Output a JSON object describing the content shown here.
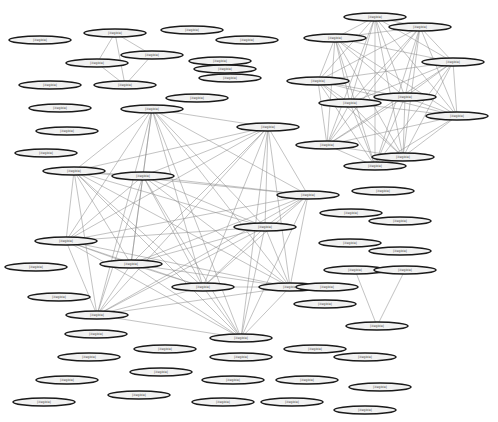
{
  "diagram": {
    "type": "network-graph",
    "node_shape": "ellipse",
    "label_note": "node labels are too small to read at this resolution; format resembles '#### ___ sample_########'",
    "colors": {
      "background": "#ffffff",
      "edge": "#8a8a8a",
      "node_fill": "#f2f2f2",
      "node_stroke": "#1a1a1a"
    },
    "nodes": [
      {
        "id": "n1",
        "x": 40,
        "y": 40,
        "w": 62,
        "label": "[illegible]"
      },
      {
        "id": "n2",
        "x": 115,
        "y": 33,
        "w": 62,
        "label": "[illegible]"
      },
      {
        "id": "n3",
        "x": 152,
        "y": 55,
        "w": 62,
        "label": "[illegible]"
      },
      {
        "id": "n4",
        "x": 97,
        "y": 63,
        "w": 62,
        "label": "[illegible]"
      },
      {
        "id": "n5",
        "x": 50,
        "y": 85,
        "w": 62,
        "label": "[illegible]"
      },
      {
        "id": "n6",
        "x": 125,
        "y": 85,
        "w": 62,
        "label": "[illegible]"
      },
      {
        "id": "n7",
        "x": 192,
        "y": 30,
        "w": 62,
        "label": "[illegible]"
      },
      {
        "id": "n8",
        "x": 247,
        "y": 40,
        "w": 62,
        "label": "[illegible]"
      },
      {
        "id": "n9",
        "x": 220,
        "y": 61,
        "w": 62,
        "label": "[illegible]"
      },
      {
        "id": "n10",
        "x": 225,
        "y": 69,
        "w": 62,
        "label": "[illegible]"
      },
      {
        "id": "n11",
        "x": 230,
        "y": 78,
        "w": 62,
        "label": "[illegible]"
      },
      {
        "id": "n12",
        "x": 197,
        "y": 98,
        "w": 62,
        "label": "[illegible]"
      },
      {
        "id": "n13",
        "x": 60,
        "y": 108,
        "w": 62,
        "label": "[illegible]"
      },
      {
        "id": "n14",
        "x": 67,
        "y": 131,
        "w": 62,
        "label": "[illegible]"
      },
      {
        "id": "n15",
        "x": 46,
        "y": 153,
        "w": 62,
        "label": "[illegible]"
      },
      {
        "id": "n16",
        "x": 152,
        "y": 109,
        "w": 62,
        "label": "[illegible]"
      },
      {
        "id": "n17",
        "x": 268,
        "y": 127,
        "w": 62,
        "label": "[illegible]"
      },
      {
        "id": "n18",
        "x": 74,
        "y": 171,
        "w": 62,
        "label": "[illegible]"
      },
      {
        "id": "n19",
        "x": 143,
        "y": 176,
        "w": 62,
        "label": "[illegible]"
      },
      {
        "id": "n20",
        "x": 308,
        "y": 195,
        "w": 62,
        "label": "[illegible]"
      },
      {
        "id": "n21",
        "x": 66,
        "y": 241,
        "w": 62,
        "label": "[illegible]"
      },
      {
        "id": "n22",
        "x": 131,
        "y": 264,
        "w": 62,
        "label": "[illegible]"
      },
      {
        "id": "n23",
        "x": 265,
        "y": 227,
        "w": 62,
        "label": "[illegible]"
      },
      {
        "id": "n24",
        "x": 203,
        "y": 287,
        "w": 62,
        "label": "[illegible]"
      },
      {
        "id": "n25",
        "x": 290,
        "y": 287,
        "w": 62,
        "label": "[illegible]"
      },
      {
        "id": "n26",
        "x": 36,
        "y": 267,
        "w": 62,
        "label": "[illegible]"
      },
      {
        "id": "n27",
        "x": 59,
        "y": 297,
        "w": 62,
        "label": "[illegible]"
      },
      {
        "id": "n28",
        "x": 97,
        "y": 315,
        "w": 62,
        "label": "[illegible]"
      },
      {
        "id": "n29",
        "x": 96,
        "y": 334,
        "w": 62,
        "label": "[illegible]"
      },
      {
        "id": "n30",
        "x": 89,
        "y": 357,
        "w": 62,
        "label": "[illegible]"
      },
      {
        "id": "n31",
        "x": 67,
        "y": 380,
        "w": 62,
        "label": "[illegible]"
      },
      {
        "id": "n32",
        "x": 44,
        "y": 402,
        "w": 62,
        "label": "[illegible]"
      },
      {
        "id": "n33",
        "x": 165,
        "y": 349,
        "w": 62,
        "label": "[illegible]"
      },
      {
        "id": "n34",
        "x": 161,
        "y": 372,
        "w": 62,
        "label": "[illegible]"
      },
      {
        "id": "n35",
        "x": 139,
        "y": 395,
        "w": 62,
        "label": "[illegible]"
      },
      {
        "id": "n36",
        "x": 241,
        "y": 338,
        "w": 62,
        "label": "[illegible]"
      },
      {
        "id": "n37",
        "x": 241,
        "y": 357,
        "w": 62,
        "label": "[illegible]"
      },
      {
        "id": "n38",
        "x": 233,
        "y": 380,
        "w": 62,
        "label": "[illegible]"
      },
      {
        "id": "n39",
        "x": 223,
        "y": 402,
        "w": 62,
        "label": "[illegible]"
      },
      {
        "id": "n40",
        "x": 315,
        "y": 349,
        "w": 62,
        "label": "[illegible]"
      },
      {
        "id": "n41",
        "x": 307,
        "y": 380,
        "w": 62,
        "label": "[illegible]"
      },
      {
        "id": "n42",
        "x": 292,
        "y": 402,
        "w": 62,
        "label": "[illegible]"
      },
      {
        "id": "n43",
        "x": 365,
        "y": 357,
        "w": 62,
        "label": "[illegible]"
      },
      {
        "id": "n44",
        "x": 380,
        "y": 387,
        "w": 62,
        "label": "[illegible]"
      },
      {
        "id": "n45",
        "x": 365,
        "y": 410,
        "w": 62,
        "label": "[illegible]"
      },
      {
        "id": "n46",
        "x": 325,
        "y": 304,
        "w": 62,
        "label": "[illegible]"
      },
      {
        "id": "n47",
        "x": 377,
        "y": 326,
        "w": 62,
        "label": "[illegible]"
      },
      {
        "id": "n48",
        "x": 355,
        "y": 270,
        "w": 62,
        "label": "[illegible]"
      },
      {
        "id": "n49",
        "x": 405,
        "y": 270,
        "w": 62,
        "label": "[illegible]"
      },
      {
        "id": "n50",
        "x": 327,
        "y": 287,
        "w": 62,
        "label": "[illegible]"
      },
      {
        "id": "n51",
        "x": 383,
        "y": 191,
        "w": 62,
        "label": "[illegible]"
      },
      {
        "id": "n52",
        "x": 351,
        "y": 213,
        "w": 62,
        "label": "[illegible]"
      },
      {
        "id": "n53",
        "x": 400,
        "y": 221,
        "w": 62,
        "label": "[illegible]"
      },
      {
        "id": "n54",
        "x": 350,
        "y": 243,
        "w": 62,
        "label": "[illegible]"
      },
      {
        "id": "n55",
        "x": 400,
        "y": 251,
        "w": 62,
        "label": "[illegible]"
      },
      {
        "id": "n56",
        "x": 375,
        "y": 17,
        "w": 62,
        "label": "[illegible]"
      },
      {
        "id": "n57",
        "x": 420,
        "y": 27,
        "w": 62,
        "label": "[illegible]"
      },
      {
        "id": "n58",
        "x": 335,
        "y": 38,
        "w": 62,
        "label": "[illegible]"
      },
      {
        "id": "n59",
        "x": 453,
        "y": 62,
        "w": 62,
        "label": "[illegible]"
      },
      {
        "id": "n60",
        "x": 318,
        "y": 81,
        "w": 62,
        "label": "[illegible]"
      },
      {
        "id": "n61",
        "x": 350,
        "y": 103,
        "w": 62,
        "label": "[illegible]"
      },
      {
        "id": "n62",
        "x": 405,
        "y": 97,
        "w": 62,
        "label": "[illegible]"
      },
      {
        "id": "n63",
        "x": 457,
        "y": 116,
        "w": 62,
        "label": "[illegible]"
      },
      {
        "id": "n64",
        "x": 327,
        "y": 145,
        "w": 62,
        "label": "[illegible]"
      },
      {
        "id": "n65",
        "x": 403,
        "y": 157,
        "w": 62,
        "label": "[illegible]"
      },
      {
        "id": "n66",
        "x": 375,
        "y": 166,
        "w": 62,
        "label": "[illegible]"
      }
    ],
    "clusters": [
      {
        "name": "top-left-cluster",
        "nodes": [
          "n2",
          "n3",
          "n4",
          "n6"
        ]
      },
      {
        "name": "large-left-cluster",
        "nodes": [
          "n16",
          "n17",
          "n18",
          "n19",
          "n20",
          "n21",
          "n22",
          "n23",
          "n24",
          "n25",
          "n28",
          "n36"
        ]
      },
      {
        "name": "right-cluster",
        "nodes": [
          "n56",
          "n57",
          "n58",
          "n59",
          "n60",
          "n61",
          "n62",
          "n63",
          "n64",
          "n65",
          "n66"
        ]
      },
      {
        "name": "triangle",
        "nodes": [
          "n48",
          "n49",
          "n47"
        ]
      }
    ],
    "extra_edges": [
      [
        "n2",
        "n4"
      ],
      [
        "n2",
        "n3"
      ],
      [
        "n2",
        "n6"
      ],
      [
        "n4",
        "n6"
      ],
      [
        "n3",
        "n6"
      ],
      [
        "n48",
        "n47"
      ],
      [
        "n49",
        "n47"
      ]
    ]
  }
}
